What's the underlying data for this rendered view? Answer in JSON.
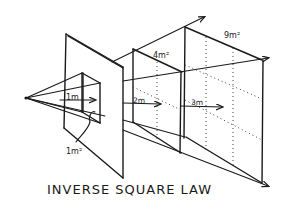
{
  "title": "INVERSE SQUARE LAW",
  "labels": {
    "distance_1": "1m",
    "distance_2": "2m",
    "distance_3": "3m",
    "area_1": "1m²",
    "area_2": "4m²",
    "area_3": "9m²"
  },
  "colors": {
    "ink": "#1a1a1a",
    "background": "#ffffff"
  },
  "elements": {
    "source": "point-light-source",
    "planes": [
      "1m plane (1m²)",
      "2m plane (4m²)",
      "3m plane (9m²)"
    ]
  }
}
